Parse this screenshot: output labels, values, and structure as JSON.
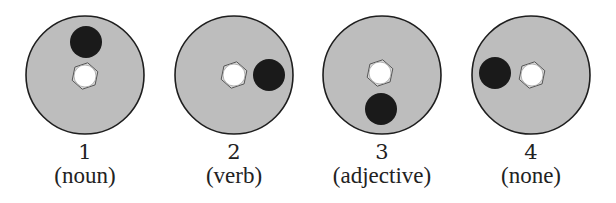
{
  "colors": {
    "background": "#ffffff",
    "disk_fill": "#bdbdbd",
    "disk_stroke": "#1e1e1e",
    "dot_fill": "#1a1a1a",
    "hole_fill": "#ffffff",
    "hole_stroke": "#555555"
  },
  "figures": [
    {
      "number": "1",
      "label": "(noun)",
      "disk": {
        "cx": 85,
        "cy": 75,
        "r": 59
      },
      "hole": {
        "cx": 85,
        "cy": 76,
        "r": 11
      },
      "dot": {
        "cx": 86,
        "cy": 42,
        "r": 16
      }
    },
    {
      "number": "2",
      "label": "(verb)",
      "disk": {
        "cx": 234,
        "cy": 75,
        "r": 59
      },
      "hole": {
        "cx": 234,
        "cy": 75,
        "r": 11
      },
      "dot": {
        "cx": 269,
        "cy": 75,
        "r": 16
      }
    },
    {
      "number": "3",
      "label": "(adjective)",
      "disk": {
        "cx": 382,
        "cy": 75,
        "r": 59
      },
      "hole": {
        "cx": 380,
        "cy": 73,
        "r": 11
      },
      "dot": {
        "cx": 381,
        "cy": 109,
        "r": 16
      }
    },
    {
      "number": "4",
      "label": "(none)",
      "disk": {
        "cx": 531,
        "cy": 75,
        "r": 59
      },
      "hole": {
        "cx": 532,
        "cy": 75,
        "r": 11
      },
      "dot": {
        "cx": 495,
        "cy": 73,
        "r": 16
      }
    }
  ]
}
